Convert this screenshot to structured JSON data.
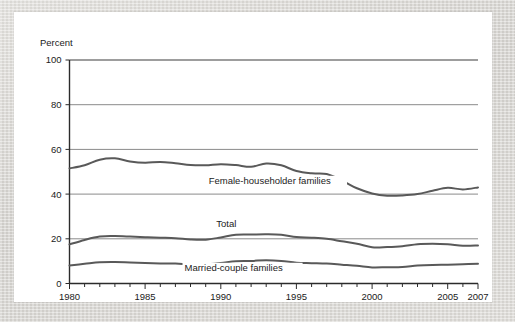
{
  "chart_data": {
    "type": "line",
    "title": "",
    "xlabel": "",
    "ylabel": "Percent",
    "ylim": [
      0,
      100
    ],
    "xlim": [
      1980,
      2007
    ],
    "grid": true,
    "legend_position": "inline-labels",
    "y_ticks": [
      "0",
      "20",
      "40",
      "60",
      "80",
      "100"
    ],
    "x_ticks": [
      "1980",
      "1985",
      "1990",
      "1995",
      "2000",
      "2005",
      "2007"
    ],
    "x_tick_values": [
      1980,
      1985,
      1990,
      1995,
      2000,
      2005,
      2007
    ],
    "x_minor_tick_interval": 1,
    "x": [
      1980,
      1981,
      1982,
      1983,
      1984,
      1985,
      1986,
      1987,
      1988,
      1989,
      1990,
      1991,
      1992,
      1993,
      1994,
      1995,
      1996,
      1997,
      1998,
      1999,
      2000,
      2001,
      2002,
      2003,
      2004,
      2005,
      2006,
      2007
    ],
    "series": [
      {
        "name": "Female-householder families",
        "label": "Female-householder families",
        "color": "#595959",
        "values": [
          51.5,
          52.9,
          55.4,
          56.0,
          54.6,
          54.0,
          54.4,
          53.8,
          53.0,
          52.9,
          53.4,
          53.0,
          52.2,
          53.7,
          52.9,
          50.3,
          49.3,
          49.0,
          46.1,
          42.6,
          40.3,
          39.3,
          39.4,
          40.0,
          41.5,
          42.8,
          42.1,
          43.0
        ]
      },
      {
        "name": "Total",
        "label": "Total",
        "color": "#595959",
        "values": [
          17.5,
          19.5,
          21.0,
          21.2,
          21.0,
          20.7,
          20.5,
          20.3,
          19.7,
          19.6,
          20.6,
          21.8,
          21.9,
          22.0,
          21.8,
          20.8,
          20.5,
          20.0,
          18.9,
          17.8,
          16.2,
          16.3,
          16.7,
          17.6,
          17.8,
          17.6,
          16.9,
          17.0
        ]
      },
      {
        "name": "Married-couple families",
        "label": "Married-couple families",
        "color": "#595959",
        "values": [
          8.1,
          8.8,
          9.5,
          9.6,
          9.4,
          9.2,
          9.0,
          8.9,
          8.6,
          8.6,
          9.2,
          10.0,
          10.1,
          10.4,
          10.1,
          9.3,
          9.1,
          8.9,
          8.4,
          7.9,
          7.2,
          7.3,
          7.4,
          8.0,
          8.3,
          8.4,
          8.6,
          8.8
        ]
      }
    ],
    "annotations": [
      {
        "text": "Female-householder families",
        "x": 1989.2,
        "y": 44.5
      },
      {
        "text": "Total",
        "x": 1989.7,
        "y": 25.2
      },
      {
        "text": "Married-couple families",
        "x": 1987.6,
        "y": 5.6
      }
    ]
  }
}
